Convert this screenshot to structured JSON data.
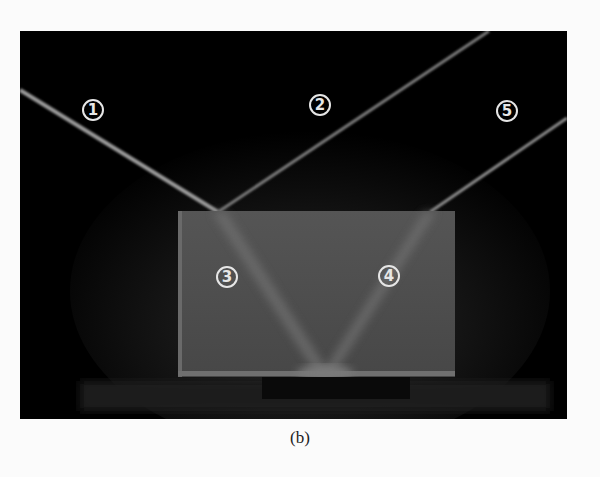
{
  "figure": {
    "caption": "(b)",
    "labels": [
      {
        "id": "ray-1",
        "text": "1",
        "x": 92,
        "y": 110
      },
      {
        "id": "ray-2",
        "text": "2",
        "x": 320,
        "y": 105
      },
      {
        "id": "ray-3",
        "text": "3",
        "x": 227,
        "y": 276
      },
      {
        "id": "ray-4",
        "text": "4",
        "x": 389,
        "y": 275
      },
      {
        "id": "ray-5",
        "text": "5",
        "x": 507,
        "y": 111
      }
    ],
    "colors": {
      "background": "#000000",
      "page": "#fbfbfb",
      "block": "#4a4a4a",
      "ray": "#9a9a9a",
      "label": "#e6e6e6"
    }
  }
}
